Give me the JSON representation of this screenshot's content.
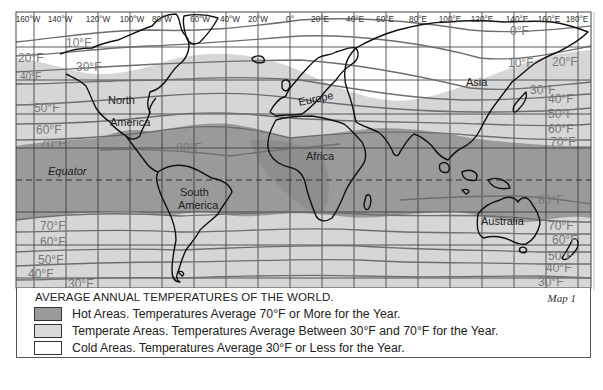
{
  "map": {
    "title": "AVERAGE ANNUAL TEMPERATURES OF THE WORLD.",
    "map_number": "Map 1",
    "longitude_labels": [
      "160°W",
      "140°W",
      "120°W",
      "100°W",
      "80°W",
      "60°W",
      "40°W",
      "20°W",
      "0°",
      "20°E",
      "40°E",
      "60°E",
      "80°E",
      "100°E",
      "120°E",
      "140°E",
      "160°E",
      "180°E"
    ],
    "equator_label": "Equator",
    "continent_labels": {
      "north_america_1": "North",
      "north_america_2": "America",
      "south_america_1": "South",
      "south_america_2": "America",
      "europe": "Europe",
      "africa": "Africa",
      "asia": "Asia",
      "australia": "Australia"
    },
    "isotherm_labels": {
      "left_north": [
        "10°F",
        "20°F",
        "30°F",
        "50°F",
        "60°F",
        "70°F"
      ],
      "left_north_40": "40°F",
      "mid_80": "80°F",
      "right_north": [
        "10°F",
        "20°F",
        "30°F",
        "40°F",
        "50°F",
        "60°F",
        "70°F"
      ],
      "left_south": [
        "70°F",
        "60°F",
        "50°F",
        "40°F",
        "30°F"
      ],
      "right_south": [
        "80°F",
        "70°F",
        "60°F",
        "50°F",
        "40°F",
        "30°F"
      ],
      "top_right_0": "0°F"
    }
  },
  "legend": {
    "items": [
      {
        "label": "Hot Areas. Temperatures Average 70°F or More for the Year.",
        "color": "#9a9a9a"
      },
      {
        "label": "Temperate Areas. Temperatures Average Between 30°F and 70°F for the Year.",
        "color": "#d9d9d9"
      },
      {
        "label": "Cold Areas. Temperatures Average 30°F or Less for the Year.",
        "color": "#ffffff"
      }
    ]
  },
  "colors": {
    "hot": "#9a9a9a",
    "temperate": "#d6d6d6",
    "cold": "#ffffff",
    "isotherm": "#6e6e6e",
    "coast": "#111111",
    "grid": "#333333"
  }
}
